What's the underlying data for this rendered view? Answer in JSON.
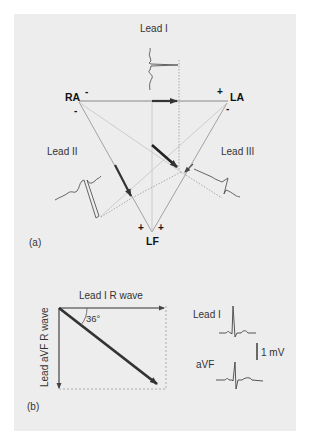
{
  "figure": {
    "panel_a": {
      "label": "(a)",
      "leads": {
        "lead_i": "Lead I",
        "lead_ii": "Lead II",
        "lead_iii": "Lead III"
      },
      "electrodes": {
        "ra": "RA",
        "la": "LA",
        "lf": "LF"
      },
      "polarity": {
        "ra_top": "-",
        "ra_bottom": "-",
        "la_top": "+",
        "la_bottom": "-",
        "lf_left": "+",
        "lf_right": "+"
      }
    },
    "panel_b": {
      "label": "(b)",
      "x_axis_label": "Lead I R wave",
      "y_axis_label": "Lead aVF R wave",
      "angle_label": "36°",
      "trace_labels": {
        "lead_i": "Lead I",
        "avf": "aVF"
      },
      "scale_bar": "1 mV"
    }
  }
}
